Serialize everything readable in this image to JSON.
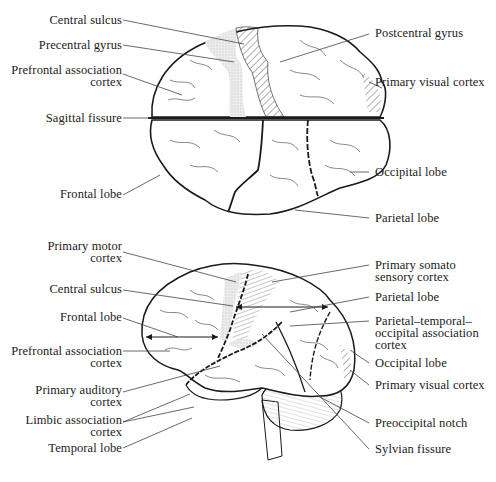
{
  "figure": {
    "top_view": {
      "labels_left": {
        "central_sulcus": "Central sulcus",
        "precentral_gyrus": "Precentral gyrus",
        "prefrontal_1": "Prefrontal association",
        "prefrontal_2": "cortex",
        "sagittal_fissure": "Sagittal fissure",
        "frontal_lobe": "Frontal lobe"
      },
      "labels_right": {
        "postcentral_gyrus": "Postcentral gyrus",
        "primary_visual_cortex": "Primary visual cortex",
        "occipital_lobe": "Occipital lobe",
        "parietal_lobe": "Parietal lobe"
      }
    },
    "lateral_view": {
      "labels_left": {
        "primary_motor_1": "Primary motor",
        "primary_motor_2": "cortex",
        "central_sulcus": "Central sulcus",
        "frontal_lobe": "Frontal lobe",
        "prefrontal_1": "Prefrontal association",
        "prefrontal_2": "cortex",
        "primary_auditory_1": "Primary auditory",
        "primary_auditory_2": "cortex",
        "limbic_1": "Limbic association",
        "limbic_2": "cortex",
        "temporal_lobe": "Temporal lobe"
      },
      "labels_right": {
        "somato_1": "Primary somato",
        "somato_2": "sensory cortex",
        "parietal_lobe": "Parietal lobe",
        "pto_1": "Parietal–temporal–",
        "pto_2": "occipital association",
        "pto_3": "cortex",
        "occipital_lobe": "Occipital lobe",
        "primary_visual_cortex": "Primary visual cortex",
        "preoccipital_notch": "Preoccipital notch",
        "sylvian_fissure": "Sylvian fissure"
      }
    },
    "colors": {
      "ink": "#1a1a1a",
      "leader": "#444444",
      "stipple": "#d9d9d9",
      "background": "#ffffff"
    }
  }
}
